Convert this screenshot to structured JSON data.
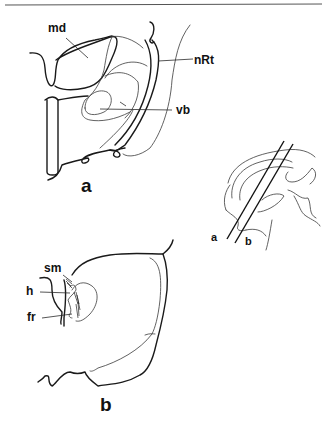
{
  "figure": {
    "top_rule": true,
    "panel_a": {
      "panel_label": "a",
      "structures": [
        {
          "id": "md",
          "label": "md"
        },
        {
          "id": "nRt",
          "label": "nRt"
        },
        {
          "id": "vb",
          "label": "vb"
        }
      ]
    },
    "panel_b": {
      "panel_label": "b",
      "structures": [
        {
          "id": "sm",
          "label": "sm"
        },
        {
          "id": "h",
          "label": "h"
        },
        {
          "id": "fr",
          "label": "fr"
        }
      ]
    },
    "inset": {
      "description": "sagittal brain outline with two oblique section planes",
      "plane_labels": [
        "a",
        "b"
      ]
    }
  }
}
